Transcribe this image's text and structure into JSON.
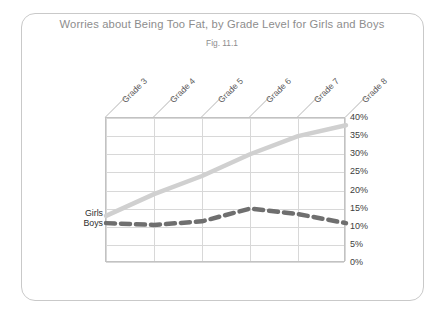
{
  "chart_data": {
    "type": "line",
    "title": "Worries about Being Too Fat, by Grade Level for Girls and Boys",
    "subtitle": "Fig. 11.1",
    "xlabel": "",
    "ylabel": "",
    "categories": [
      "Grade 3",
      "Grade 4",
      "Grade 5",
      "Grade 6",
      "Grade 7",
      "Grade 8"
    ],
    "ytick_labels": [
      "40%",
      "35%",
      "30%",
      "25%",
      "20%",
      "15%",
      "10%",
      "5%",
      "0%"
    ],
    "ytick_values": [
      40,
      35,
      30,
      25,
      20,
      15,
      10,
      5,
      0
    ],
    "ylim": [
      0,
      40
    ],
    "yaxis_position": "right",
    "grid": true,
    "legend_position": "inline-left",
    "series": [
      {
        "name": "Girls",
        "values": [
          13,
          19,
          24,
          30,
          35,
          38
        ],
        "color": "#d0d0d0",
        "style": "solid",
        "width": 4.5
      },
      {
        "name": "Boys",
        "values": [
          11,
          10.5,
          11.5,
          15,
          13.5,
          11
        ],
        "color": "#6f6f6f",
        "style": "dashed",
        "width": 4.5
      }
    ]
  }
}
